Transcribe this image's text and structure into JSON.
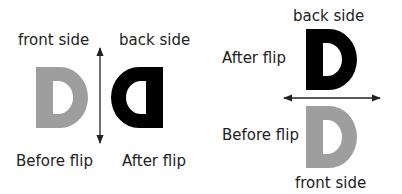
{
  "left_panel": {
    "top_left_label": "front side",
    "top_right_label": "back side",
    "bottom_left_label": "Before flip",
    "bottom_right_label": "After flip",
    "axis": "vertical"
  },
  "right_panel": {
    "top_label": "back side",
    "upper_side_label": "After flip",
    "lower_side_label": "Before flip",
    "bottom_label": "front side",
    "axis": "horizontal"
  },
  "colors": {
    "front": "#9e9e9e",
    "back": "#000000",
    "arrow": "#222222"
  }
}
